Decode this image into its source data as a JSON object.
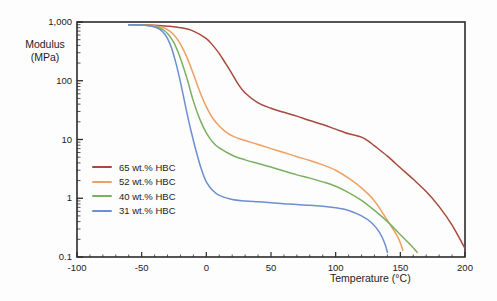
{
  "chart_data": {
    "type": "line",
    "title": "",
    "xlabel": "Temperature (°C)",
    "ylabel_line1": "Modulus",
    "ylabel_line2": "(MPa)",
    "xlim": [
      -100,
      200
    ],
    "ylim": [
      0.1,
      1000
    ],
    "yscale": "log",
    "xscale": "linear",
    "grid": false,
    "legend_position": "lower-left-inside",
    "xticks": [
      "-100",
      "-50",
      "0",
      "50",
      "100",
      "150",
      "200"
    ],
    "xtick_values": [
      -100,
      -50,
      0,
      50,
      100,
      150,
      200
    ],
    "yticks": [
      "0.1",
      "1",
      "10",
      "100",
      "1,000"
    ],
    "ytick_values": [
      0.1,
      1,
      10,
      100,
      1000
    ],
    "series": [
      {
        "name": "65 wt.% HBC",
        "color": "#a8493c",
        "x": [
          -60,
          -50,
          -40,
          -30,
          -20,
          -10,
          0,
          5,
          10,
          15,
          20,
          25,
          30,
          40,
          50,
          60,
          70,
          80,
          90,
          100,
          110,
          115,
          120,
          125,
          130,
          140,
          150,
          160,
          170,
          180,
          190,
          200
        ],
        "y": [
          900,
          895,
          880,
          850,
          800,
          700,
          520,
          400,
          290,
          195,
          130,
          85,
          62,
          42,
          34,
          29,
          25,
          21,
          18,
          15,
          12.5,
          11.8,
          11,
          9.5,
          7.8,
          5.2,
          3.3,
          2.1,
          1.3,
          0.72,
          0.35,
          0.14
        ]
      },
      {
        "name": "52 wt.% HBC",
        "color": "#f0a061",
        "x": [
          -60,
          -50,
          -45,
          -40,
          -35,
          -30,
          -25,
          -20,
          -15,
          -10,
          -5,
          0,
          5,
          10,
          15,
          20,
          25,
          30,
          40,
          50,
          60,
          70,
          80,
          90,
          100,
          110,
          120,
          130,
          140,
          148,
          152
        ],
        "y": [
          900,
          890,
          880,
          860,
          820,
          740,
          600,
          420,
          250,
          130,
          65,
          36,
          23,
          17,
          13.5,
          11.5,
          10.4,
          9.6,
          8.2,
          7.0,
          6.0,
          5.1,
          4.4,
          3.7,
          3.0,
          2.2,
          1.5,
          0.9,
          0.42,
          0.22,
          0.13
        ]
      },
      {
        "name": "40 wt.% HBC",
        "color": "#7cb05f",
        "x": [
          -60,
          -50,
          -45,
          -40,
          -35,
          -30,
          -25,
          -20,
          -15,
          -10,
          -5,
          0,
          5,
          10,
          20,
          30,
          40,
          50,
          60,
          70,
          80,
          90,
          100,
          110,
          120,
          130,
          140,
          150,
          158,
          163
        ],
        "y": [
          900,
          890,
          875,
          840,
          770,
          640,
          440,
          240,
          110,
          45,
          22,
          13,
          9.0,
          7.2,
          5.4,
          4.5,
          3.9,
          3.4,
          2.9,
          2.5,
          2.2,
          1.9,
          1.6,
          1.25,
          0.92,
          0.62,
          0.4,
          0.24,
          0.16,
          0.12
        ]
      },
      {
        "name": "31 wt.% HBC",
        "color": "#6b8fd1",
        "x": [
          -60,
          -50,
          -45,
          -40,
          -36,
          -32,
          -28,
          -24,
          -20,
          -16,
          -12,
          -8,
          -4,
          0,
          5,
          10,
          20,
          30,
          40,
          50,
          60,
          70,
          80,
          90,
          100,
          110,
          120,
          128,
          134,
          138,
          140
        ],
        "y": [
          900,
          885,
          865,
          820,
          750,
          620,
          420,
          220,
          95,
          36,
          14.5,
          6.5,
          3.2,
          1.9,
          1.35,
          1.12,
          0.95,
          0.9,
          0.87,
          0.84,
          0.81,
          0.78,
          0.76,
          0.73,
          0.69,
          0.62,
          0.5,
          0.38,
          0.26,
          0.17,
          0.12
        ]
      }
    ]
  },
  "legend": {
    "items": [
      {
        "label": "65 wt.% HBC",
        "color": "#a8493c"
      },
      {
        "label": "52 wt.% HBC",
        "color": "#f0a061"
      },
      {
        "label": "40 wt.% HBC",
        "color": "#7cb05f"
      },
      {
        "label": "31 wt.% HBC",
        "color": "#6b8fd1"
      }
    ]
  },
  "style": {
    "axis_color": "#2b2b2b",
    "text_color": "#1c1c1c",
    "background": "#fdfdfd"
  }
}
